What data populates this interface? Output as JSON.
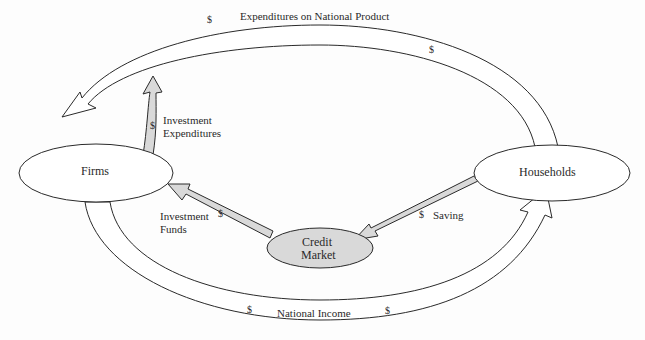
{
  "diagram": {
    "nodes": {
      "firms": {
        "label": "Firms"
      },
      "households": {
        "label": "Households"
      },
      "credit_market": {
        "line1": "Credit",
        "line2": "Market"
      }
    },
    "flows": {
      "expenditures": {
        "label": "Expenditures on National Product",
        "currency": "$"
      },
      "national_income": {
        "label": "National Income",
        "currency": "$"
      },
      "investment_expenditures": {
        "line1": "Investment",
        "line2": "Expenditures",
        "currency": "$"
      },
      "investment_funds": {
        "line1": "Investment",
        "line2": "Funds",
        "currency": "$"
      },
      "saving": {
        "label": "Saving",
        "currency": "$"
      }
    },
    "colors": {
      "stroke": "#2a2a2a",
      "gray_fill": "#d9d9d9",
      "background": "#fdfdfd"
    }
  }
}
